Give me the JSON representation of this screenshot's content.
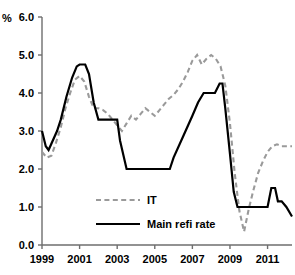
{
  "chart_data": {
    "type": "line",
    "title": "",
    "xlabel": "",
    "ylabel": "%",
    "unit_label": "%",
    "xlim": [
      1999.0,
      2012.3
    ],
    "ylim": [
      0.0,
      6.0
    ],
    "grid": false,
    "legend_position": "inside-bottom-left",
    "y_ticks": [
      "0.0",
      "1.0",
      "2.0",
      "3.0",
      "4.0",
      "5.0",
      "6.0"
    ],
    "y_tick_values": [
      0.0,
      1.0,
      2.0,
      3.0,
      4.0,
      5.0,
      6.0
    ],
    "x_ticks": [
      "1999",
      "2001",
      "2003",
      "2005",
      "2007",
      "2009",
      "2011"
    ],
    "x_tick_values": [
      1999,
      2001,
      2003,
      2005,
      2007,
      2009,
      2011
    ],
    "series": [
      {
        "name": "IT",
        "style": "dashed",
        "color": "#9a9a9a",
        "x": [
          1999.0,
          1999.25,
          1999.5,
          1999.75,
          2000.0,
          2000.25,
          2000.5,
          2000.75,
          2001.0,
          2001.25,
          2001.5,
          2001.75,
          2002.0,
          2002.25,
          2002.5,
          2002.75,
          2003.0,
          2003.25,
          2003.5,
          2003.75,
          2004.0,
          2004.25,
          2004.5,
          2004.75,
          2005.0,
          2005.25,
          2005.5,
          2005.75,
          2006.0,
          2006.25,
          2006.5,
          2006.75,
          2007.0,
          2007.25,
          2007.5,
          2007.75,
          2008.0,
          2008.25,
          2008.5,
          2008.75,
          2009.0,
          2009.25,
          2009.5,
          2009.75,
          2010.0,
          2010.25,
          2010.5,
          2010.75,
          2011.0,
          2011.25,
          2011.5,
          2011.75,
          2012.0,
          2012.3
        ],
        "y": [
          2.45,
          2.3,
          2.35,
          2.7,
          3.1,
          3.6,
          4.0,
          4.35,
          4.45,
          4.3,
          3.9,
          3.6,
          3.6,
          3.55,
          3.45,
          3.3,
          3.15,
          3.0,
          3.2,
          3.4,
          3.3,
          3.45,
          3.6,
          3.5,
          3.4,
          3.55,
          3.7,
          3.85,
          3.95,
          4.1,
          4.3,
          4.55,
          4.85,
          5.0,
          4.75,
          4.9,
          5.0,
          4.9,
          4.7,
          4.2,
          3.2,
          1.9,
          0.9,
          0.35,
          0.95,
          1.45,
          1.9,
          2.2,
          2.45,
          2.6,
          2.65,
          2.6,
          2.6,
          2.6
        ]
      },
      {
        "name": "Main refi rate",
        "style": "solid",
        "color": "#000000",
        "x": [
          1999.0,
          1999.2,
          1999.35,
          1999.8,
          2000.0,
          2000.3,
          2000.6,
          2000.85,
          2001.0,
          2001.3,
          2001.5,
          2001.75,
          2002.0,
          2002.4,
          2002.9,
          2003.0,
          2003.15,
          2003.5,
          2004.0,
          2005.0,
          2005.8,
          2006.0,
          2006.5,
          2007.0,
          2007.3,
          2007.6,
          2008.2,
          2008.45,
          2008.6,
          2008.75,
          2009.0,
          2009.2,
          2009.4,
          2010.0,
          2010.5,
          2011.0,
          2011.2,
          2011.4,
          2011.55,
          2011.75,
          2012.0,
          2012.3
        ],
        "y": [
          3.0,
          2.6,
          2.5,
          3.0,
          3.3,
          3.9,
          4.4,
          4.7,
          4.75,
          4.75,
          4.5,
          3.75,
          3.3,
          3.3,
          3.3,
          3.3,
          2.75,
          2.0,
          2.0,
          2.0,
          2.0,
          2.3,
          2.85,
          3.4,
          3.75,
          4.0,
          4.0,
          4.25,
          4.25,
          3.6,
          2.4,
          1.4,
          1.0,
          1.0,
          1.0,
          1.0,
          1.5,
          1.5,
          1.15,
          1.15,
          1.0,
          0.75
        ]
      }
    ],
    "legend": [
      {
        "label": "IT",
        "style": "dashed",
        "color": "#9a9a9a"
      },
      {
        "label": "Main refi rate",
        "style": "solid",
        "color": "#000000"
      }
    ]
  }
}
